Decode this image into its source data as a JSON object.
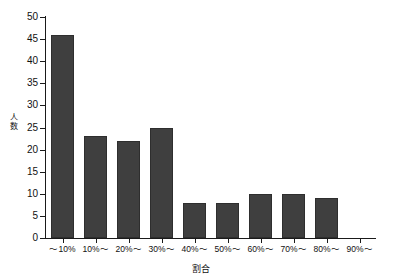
{
  "chart_data": {
    "type": "bar",
    "title": "",
    "subtitle": "",
    "xlabel": "割合",
    "ylabel": "人数",
    "categories": [
      "～10%",
      "10%～",
      "20%～",
      "30%～",
      "40%～",
      "50%～",
      "60%～",
      "70%～",
      "80%～",
      "90%～"
    ],
    "values": [
      46,
      23,
      22,
      25,
      8,
      8,
      10,
      10,
      9,
      0
    ],
    "ylim": [
      0,
      50
    ],
    "ytick_values": [
      0,
      5,
      10,
      15,
      20,
      25,
      30,
      35,
      40,
      45,
      50
    ],
    "ytick_labels": [
      "0",
      "5",
      "10",
      "15",
      "20",
      "25",
      "30",
      "35",
      "40",
      "45",
      "50"
    ],
    "grid": false,
    "legend": false,
    "legend_position": "none",
    "bar_color": "#3f3f3f",
    "axis_color": "#1a1a1a",
    "background_color": "#ffffff"
  }
}
